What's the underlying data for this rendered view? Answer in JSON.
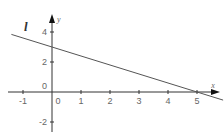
{
  "chart_data": {
    "type": "line",
    "title": "",
    "xlabel": "x",
    "ylabel": "y",
    "line_label": "l",
    "xlim": [
      -1.4,
      5.9
    ],
    "ylim": [
      -2.7,
      5.1
    ],
    "grid": false,
    "x_ticks": [
      -1,
      0,
      1,
      2,
      3,
      4,
      5
    ],
    "x_tick_labels": [
      "-1",
      "0",
      "1",
      "2",
      "3",
      "4",
      "5"
    ],
    "y_ticks": [
      -2,
      0,
      2,
      4
    ],
    "y_tick_labels": [
      "-2",
      "0",
      "2",
      "4"
    ],
    "origin_label": "0",
    "series": [
      {
        "name": "l",
        "equation": "y = -0.6x + 3",
        "x": [
          -1.4,
          0,
          5,
          5.9
        ],
        "y": [
          3.84,
          3,
          0,
          -0.54
        ]
      }
    ],
    "colors": {
      "axes": "#333333",
      "line": "#555555",
      "text": "#666666"
    }
  }
}
